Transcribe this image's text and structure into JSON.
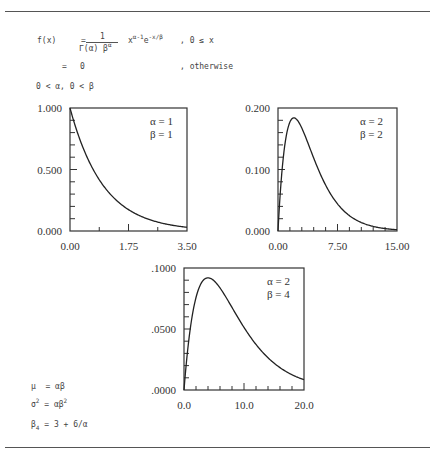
{
  "formula": {
    "lhs": "f(x)",
    "eq": "=",
    "numerator": "1",
    "denominator": "Γ(α) β",
    "denominator_sup": "α",
    "kernel_base": "x",
    "kernel_sup1": "α-1",
    "kernel_e": "e",
    "kernel_sup2": "-x/β",
    "domain": ", 0 ≤ x",
    "otherwise_eq": "=",
    "otherwise_val": "0",
    "otherwise_label": ", otherwise",
    "constraints": "0 < α, 0 < β"
  },
  "moments": {
    "mean": {
      "lhs": "μ",
      "rhs": "= αβ"
    },
    "variance": {
      "lhs": "σ",
      "lhs_sup": "2",
      "rhs": "= αβ",
      "rhs_sup": "2"
    },
    "kurtosis": {
      "lhs": "β",
      "lhs_sub": "4",
      "rhs": "= 3 + 6/α"
    }
  },
  "chart_data": [
    {
      "type": "line",
      "title": "Gamma density α=1, β=1",
      "alpha_label": "α = 1",
      "beta_label": "β = 1",
      "alpha": 1,
      "beta": 1,
      "xlim": [
        0,
        3.5
      ],
      "ylim": [
        0,
        1.0
      ],
      "xticks": [
        "0.00",
        "1.75",
        "3.50"
      ],
      "yticks": [
        "0.000",
        "0.500",
        "1.000"
      ],
      "x": [
        0,
        0.5,
        1.0,
        1.5,
        2.0,
        2.5,
        3.0,
        3.5
      ],
      "y": [
        1.0,
        0.607,
        0.368,
        0.223,
        0.135,
        0.082,
        0.05,
        0.03
      ],
      "xlabel": "",
      "ylabel": "",
      "grid": false
    },
    {
      "type": "line",
      "title": "Gamma density α=2, β=2",
      "alpha_label": "α = 2",
      "beta_label": "β = 2",
      "alpha": 2,
      "beta": 2,
      "xlim": [
        0,
        15
      ],
      "ylim": [
        0,
        0.2
      ],
      "xticks": [
        "0.00",
        "7.50",
        "15.00"
      ],
      "yticks": [
        "0.000",
        "0.100",
        "0.200"
      ],
      "x": [
        0,
        1,
        2,
        3,
        4,
        6,
        8,
        10,
        12,
        15
      ],
      "y": [
        0,
        0.152,
        0.184,
        0.167,
        0.135,
        0.075,
        0.037,
        0.017,
        0.007,
        0.002
      ],
      "xlabel": "",
      "ylabel": "",
      "grid": false
    },
    {
      "type": "line",
      "title": "Gamma density α=2, β=4",
      "alpha_label": "α = 2",
      "beta_label": "β = 4",
      "alpha": 2,
      "beta": 4,
      "xlim": [
        0,
        20
      ],
      "ylim": [
        0,
        0.1
      ],
      "xticks": [
        "0.0",
        "10.0",
        "20.0"
      ],
      "yticks": [
        ".0000",
        ".0500",
        ".1000"
      ],
      "x": [
        0,
        2,
        4,
        6,
        8,
        10,
        12,
        14,
        16,
        18,
        20
      ],
      "y": [
        0,
        0.076,
        0.092,
        0.084,
        0.068,
        0.051,
        0.037,
        0.026,
        0.018,
        0.013,
        0.008
      ],
      "xlabel": "",
      "ylabel": "",
      "grid": false
    }
  ]
}
